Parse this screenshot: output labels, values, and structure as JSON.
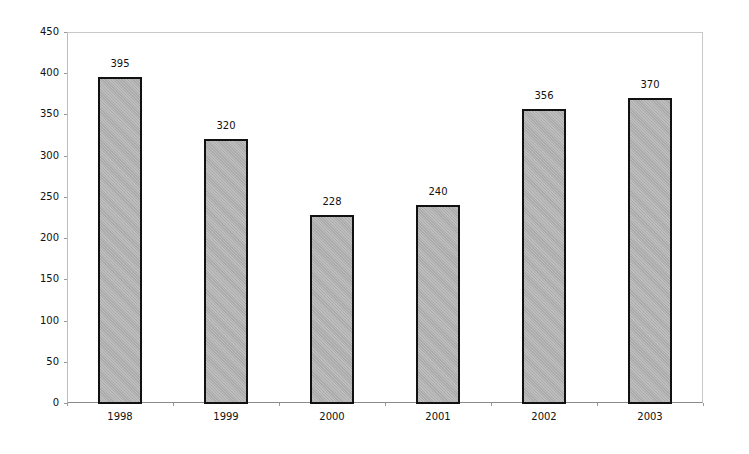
{
  "chart_data": {
    "type": "bar",
    "title": "",
    "xlabel": "",
    "ylabel": "",
    "categories": [
      "1998",
      "1999",
      "2000",
      "2001",
      "2002",
      "2003"
    ],
    "values": [
      395,
      320,
      228,
      240,
      356,
      370
    ],
    "data_labels": [
      "395",
      "320",
      "228",
      "240",
      "356",
      "370"
    ],
    "ylim": [
      0,
      450
    ],
    "yticks": [
      0,
      50,
      100,
      150,
      200,
      250,
      300,
      350,
      400,
      450
    ],
    "ytick_labels": [
      "0",
      "50",
      "100",
      "150",
      "200",
      "250",
      "300",
      "350",
      "400",
      "450"
    ],
    "grid": false,
    "legend": null,
    "bar_color": "#b5b5b5",
    "bar_edge_color": "#111111"
  }
}
